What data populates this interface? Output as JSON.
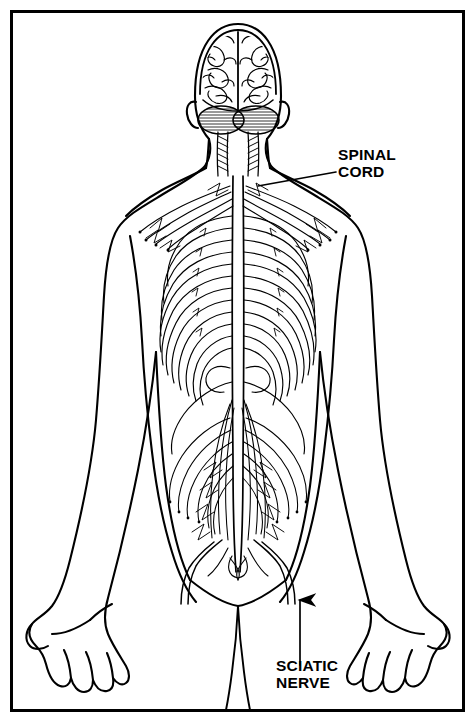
{
  "figure": {
    "view": "posterior",
    "line_color": "#000000",
    "background_color": "#ffffff",
    "border_color": "#000000"
  },
  "labels": {
    "spinal_cord": "SPINAL\nCORD",
    "sciatic_nerve": "SCIATIC\nNERVE"
  },
  "structures": {
    "brain": "cerebrum",
    "cerebellum": "cerebellum",
    "brainstem": "brainstem",
    "spinal_column": "spinal cord",
    "brachial_plexus": "brachial plexus",
    "intercostal_nerves": "intercostal nerves",
    "cauda_equina": "cauda equina",
    "sciatic": "sciatic nerve"
  }
}
